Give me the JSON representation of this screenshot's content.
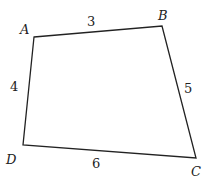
{
  "figure": {
    "type": "quadrilateral",
    "vertices": [
      {
        "name": "A",
        "x": 34,
        "y": 37
      },
      {
        "name": "B",
        "x": 162,
        "y": 26
      },
      {
        "name": "C",
        "x": 196,
        "y": 158
      },
      {
        "name": "D",
        "x": 23,
        "y": 145
      }
    ],
    "labels": {
      "A": "A",
      "B": "B",
      "C": "C",
      "D": "D"
    },
    "sides": {
      "AB": "3",
      "BC": "5",
      "CD": "6",
      "DA": "4"
    },
    "stroke_color": "#222222"
  }
}
